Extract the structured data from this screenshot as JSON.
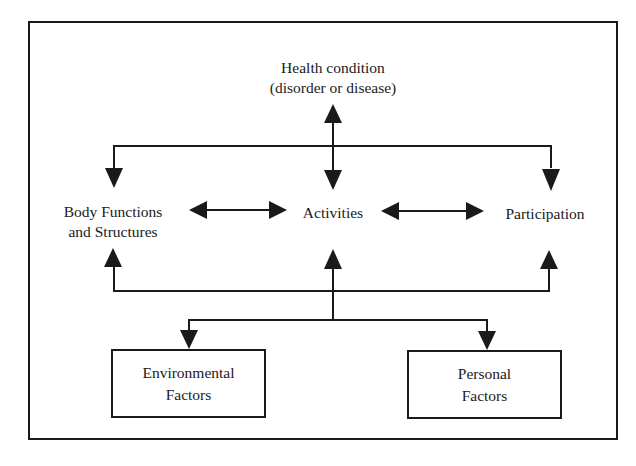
{
  "diagram": {
    "type": "ICF model flow diagram",
    "nodes": {
      "health_condition": {
        "line1": "Health condition",
        "line2": "(disorder or disease)"
      },
      "body_functions": {
        "line1": "Body Functions",
        "line2": "and Structures"
      },
      "activities": {
        "label": "Activities"
      },
      "participation": {
        "label": "Participation"
      },
      "environmental_factors": {
        "line1": "Environmental",
        "line2": "Factors"
      },
      "personal_factors": {
        "line1": "Personal",
        "line2": "Factors"
      }
    },
    "edges": [
      {
        "from": "activities",
        "to": "health_condition",
        "type": "arrow-up"
      },
      {
        "from": "health_condition-bus",
        "to": "body_functions",
        "type": "arrow-down"
      },
      {
        "from": "health_condition-bus",
        "to": "activities",
        "type": "arrow-down"
      },
      {
        "from": "health_condition-bus",
        "to": "participation",
        "type": "arrow-down"
      },
      {
        "from": "body_functions",
        "to": "activities",
        "type": "bidirectional"
      },
      {
        "from": "activities",
        "to": "participation",
        "type": "bidirectional"
      },
      {
        "from": "contextual-bus",
        "to": "body_functions",
        "type": "arrow-up"
      },
      {
        "from": "contextual-bus",
        "to": "activities",
        "type": "arrow-up"
      },
      {
        "from": "contextual-bus",
        "to": "participation",
        "type": "arrow-up"
      },
      {
        "from": "contextual-bus",
        "to": "environmental_factors",
        "type": "arrow-down"
      },
      {
        "from": "contextual-bus",
        "to": "personal_factors",
        "type": "arrow-down"
      }
    ],
    "colors": {
      "line": "#1a1a1a",
      "background": "#ffffff"
    }
  }
}
